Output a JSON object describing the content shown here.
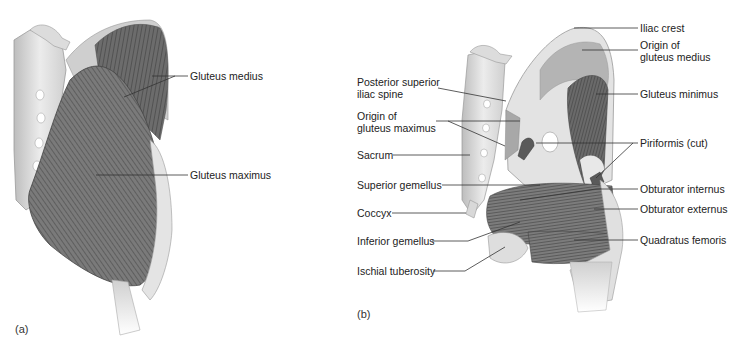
{
  "figure": {
    "panels": [
      {
        "id": "a",
        "tag": "(a)",
        "labels": [
          {
            "text": "Gluteus medius"
          },
          {
            "text": "Gluteus maximus"
          }
        ]
      },
      {
        "id": "b",
        "tag": "(b)",
        "labels_left": [
          {
            "text": "Posterior superior\niliac spine",
            "line1": "Posterior superior",
            "line2": "iliac spine"
          },
          {
            "text": "Origin of\ngluteus maximus",
            "line1": "Origin of",
            "line2": "gluteus maximus"
          },
          {
            "text": "Sacrum"
          },
          {
            "text": "Superior gemellus"
          },
          {
            "text": "Coccyx"
          },
          {
            "text": "Inferior gemellus"
          },
          {
            "text": "Ischial tuberosity"
          }
        ],
        "labels_right": [
          {
            "text": "Iliac crest"
          },
          {
            "text": "Origin of\ngluteus medius",
            "line1": "Origin of",
            "line2": "gluteus medius"
          },
          {
            "text": "Gluteus minimus"
          },
          {
            "text": "Piriformis (cut)"
          },
          {
            "text": "Obturator internus"
          },
          {
            "text": "Obturator externus"
          },
          {
            "text": "Quadratus femoris"
          }
        ]
      }
    ],
    "colors": {
      "background": "#ffffff",
      "bone": "#e6e6e6",
      "bone_shade": "#c4c4c4",
      "muscle_dark": "#5a5a5a",
      "muscle_mid": "#808080",
      "leader_line": "#333333"
    }
  }
}
